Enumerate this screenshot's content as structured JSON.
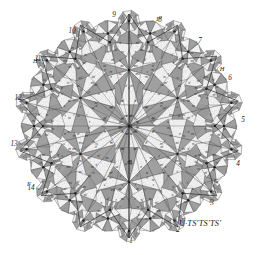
{
  "figure": {
    "caption": "U·TS′TS′TS′",
    "background_color": "#ffffff",
    "ink_color": "#2b2b2b",
    "shaded_color": "#9a9a9a",
    "unshaded_color": "#f2f2f2",
    "line_color": "#3a3a3a",
    "star_points": 14,
    "center": {
      "x": 129,
      "y": 126
    },
    "outer_radius": 112,
    "inner_radius": 86,
    "hub_radius": 56
  },
  "center_labels": [
    {
      "text": "A",
      "x": 130.5,
      "y": 127.5
    },
    {
      "text": "B",
      "x": 130.0,
      "y": 164.0
    }
  ],
  "outer_labels": [
    {
      "text": "1",
      "x": 131,
      "y": 243
    },
    {
      "text": "2",
      "x": 178,
      "y": 232
    },
    {
      "text": "3",
      "x": 212,
      "y": 205
    },
    {
      "text": "4",
      "x": 238,
      "y": 166
    },
    {
      "text": "5",
      "x": 243,
      "y": 122
    },
    {
      "text": "6",
      "x": 230,
      "y": 80
    },
    {
      "text": "7",
      "x": 200,
      "y": 43
    },
    {
      "text": "8",
      "x": 160,
      "y": 22
    },
    {
      "text": "9",
      "x": 114,
      "y": 17
    },
    {
      "text": "10",
      "x": 72,
      "y": 33
    },
    {
      "text": "11",
      "x": 38,
      "y": 61
    },
    {
      "text": "12",
      "x": 18,
      "y": 100
    },
    {
      "text": "13",
      "x": 14,
      "y": 146
    },
    {
      "text": "14",
      "x": 31,
      "y": 190
    }
  ],
  "letter_labels": [
    {
      "text": "F",
      "x": 29,
      "y": 186
    },
    {
      "text": "F′",
      "x": 159,
      "y": 21
    },
    {
      "text": "G",
      "x": 216,
      "y": 183
    },
    {
      "text": "H",
      "x": 222,
      "y": 71
    },
    {
      "text": "H′",
      "x": 36,
      "y": 63
    }
  ],
  "cell_labels": [
    "σ",
    "σ′",
    "τ",
    "τ′",
    "υ",
    "υ′",
    "στ",
    "στ′",
    "τυ",
    "τυ′",
    "συ",
    "συ′",
    "στυ",
    "ττ′",
    "υυ′",
    "σσ′"
  ],
  "chart_data": {
    "type": "diagram",
    "symmetry_order": 14,
    "rings": [
      {
        "name": "center-hub",
        "radius": 0,
        "spokes": 12,
        "triangle_count": 12
      },
      {
        "name": "inner-ring",
        "radius": 56,
        "spokes": 12,
        "hub_count": 6,
        "triangle_count": 72
      },
      {
        "name": "middle-ring",
        "radius": 86,
        "spokes": 10,
        "hub_count": 14,
        "triangle_count": 140
      },
      {
        "name": "outer-ring",
        "radius": 108,
        "spokes": 8,
        "hub_count": 28,
        "triangle_count": 224
      }
    ]
  }
}
